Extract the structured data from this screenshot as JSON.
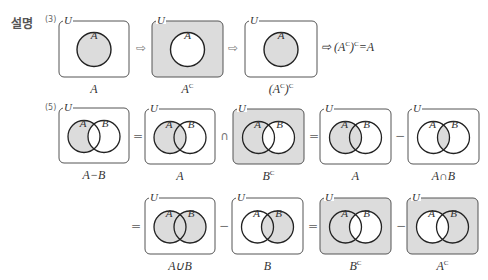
{
  "heading": "설명",
  "colors": {
    "shade": "#dcdcdc",
    "box_border": "#555555",
    "circle_stroke": "#222222",
    "background": "#ffffff"
  },
  "parts": [
    {
      "label": "(3)",
      "label_pos": [
        45,
        15
      ],
      "equation": {
        "text": "⇨ (A",
        "sup1": "C",
        "mid": ")",
        "sup2": "C",
        "end": "=A",
        "pos": [
          321,
          40
        ]
      },
      "items": [
        {
          "type": "venn1",
          "box": [
            59,
            21,
            70,
            56
          ],
          "shade": "inside",
          "caption": "A",
          "caption_sup": ""
        },
        {
          "type": "op",
          "symbol": "⇨",
          "pos": [
            136,
            41
          ]
        },
        {
          "type": "venn1",
          "box": [
            152,
            21,
            71,
            56
          ],
          "shade": "outside",
          "caption": "A",
          "caption_sup": "C"
        },
        {
          "type": "op",
          "symbol": "⇨",
          "pos": [
            228,
            41
          ]
        },
        {
          "type": "venn1",
          "box": [
            245,
            21,
            72,
            56
          ],
          "shade": "inside",
          "caption": "(A",
          "caption_sup": "C",
          "caption_tail": ")",
          "caption_sup2": "C"
        }
      ]
    },
    {
      "label": "(5)",
      "label_pos": [
        45,
        103
      ],
      "items": [
        {
          "type": "venn2",
          "box": [
            59,
            108,
            70,
            55
          ],
          "shade": "A-B",
          "caption": "A−B",
          "caption_sup": ""
        },
        {
          "type": "op",
          "symbol": "=",
          "pos": [
            133,
            129
          ]
        },
        {
          "type": "venn2",
          "box": [
            145,
            109,
            70,
            55
          ],
          "shade": "A",
          "caption": "A",
          "caption_sup": ""
        },
        {
          "type": "op",
          "symbol": "∩",
          "pos": [
            220,
            129
          ]
        },
        {
          "type": "venn2",
          "box": [
            233,
            109,
            71,
            55
          ],
          "shade": "Bc",
          "caption": "B",
          "caption_sup": "C"
        },
        {
          "type": "op",
          "symbol": "=",
          "pos": [
            309,
            129
          ]
        },
        {
          "type": "venn2",
          "box": [
            320,
            109,
            71,
            55
          ],
          "shade": "A",
          "caption": "A",
          "caption_sup": ""
        },
        {
          "type": "op",
          "symbol": "−",
          "pos": [
            395,
            129
          ]
        },
        {
          "type": "venn2",
          "box": [
            408,
            109,
            71,
            55
          ],
          "shade": "AnB",
          "caption": "A∩B",
          "caption_sup": ""
        }
      ]
    },
    {
      "label": "",
      "items": [
        {
          "type": "op",
          "symbol": "=",
          "pos": [
            131,
            219
          ]
        },
        {
          "type": "venn2",
          "box": [
            145,
            198,
            70,
            56
          ],
          "shade": "AuB",
          "caption": "A∪B",
          "caption_sup": ""
        },
        {
          "type": "op",
          "symbol": "−",
          "pos": [
            219,
            219
          ]
        },
        {
          "type": "venn2",
          "box": [
            232,
            198,
            71,
            56
          ],
          "shade": "B",
          "caption": "B",
          "caption_sup": ""
        },
        {
          "type": "op",
          "symbol": "=",
          "pos": [
            308,
            219
          ]
        },
        {
          "type": "venn2",
          "box": [
            320,
            198,
            71,
            56
          ],
          "shade": "Bc",
          "caption": "B",
          "caption_sup": "C"
        },
        {
          "type": "op",
          "symbol": "−",
          "pos": [
            396,
            219
          ]
        },
        {
          "type": "venn2",
          "box": [
            407,
            198,
            71,
            56
          ],
          "shade": "Ac",
          "caption": "A",
          "caption_sup": "C"
        }
      ]
    }
  ],
  "set_labels": {
    "universe": "U",
    "a": "A",
    "b": "B"
  }
}
